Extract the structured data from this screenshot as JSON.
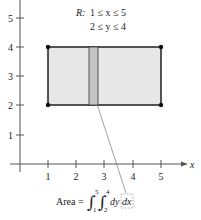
{
  "region": {
    "label": "R:",
    "line1": "1 ≤ x ≤ 5",
    "line2": "2 ≤ y ≤ 4"
  },
  "axes": {
    "x_label": "x",
    "x_ticks": [
      "1",
      "2",
      "3",
      "4",
      "5"
    ],
    "y_ticks": [
      "1",
      "2",
      "3",
      "4",
      "5"
    ]
  },
  "formula": {
    "prefix": "Area =",
    "outer_upper": "5",
    "outer_lower": "1",
    "inner_upper": "4",
    "inner_lower": "2",
    "integrand": "dy",
    "outer_diff": "dx"
  },
  "colors": {
    "rect_fill": "#e8e8e8",
    "strip_fill": "#c4c4c4",
    "line": "#111111"
  }
}
